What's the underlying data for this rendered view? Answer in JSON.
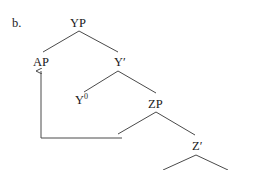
{
  "diagram": {
    "label": "b.",
    "nodes": {
      "yp": "YP",
      "ap": "AP",
      "ybar": "Y′",
      "y0_base": "Y",
      "y0_sup": "0",
      "zp": "ZP",
      "zbar": "Z′"
    },
    "colors": {
      "text": "#1a1a1a",
      "line": "#4a4a4a"
    }
  }
}
